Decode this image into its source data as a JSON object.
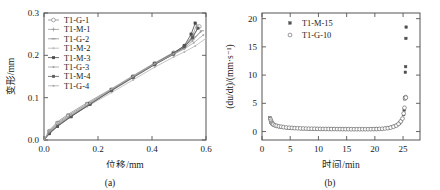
{
  "figure": {
    "panels": [
      {
        "id": "a",
        "caption": "(a)",
        "chart_ref": 0
      },
      {
        "id": "b",
        "caption": "(b)",
        "chart_ref": 1
      }
    ]
  },
  "chart_data": [
    {
      "type": "line",
      "title": "",
      "xlabel": "位移/mm",
      "ylabel": "变形/mm",
      "xlim": [
        0.0,
        0.6
      ],
      "ylim": [
        0.0,
        0.3
      ],
      "xticks": [
        "0.0",
        "0.2",
        "0.4",
        "0.6"
      ],
      "yticks": [
        "0.0",
        "0.1",
        "0.2",
        "0.3"
      ],
      "grid": false,
      "legend_position": "top-left",
      "series": [
        {
          "name": "T1-G-1",
          "marker": "open-circle",
          "color": "#8a8a8a",
          "x": [
            0.0,
            0.02,
            0.05,
            0.09,
            0.16,
            0.25,
            0.33,
            0.41,
            0.48,
            0.52,
            0.55,
            0.575
          ],
          "y": [
            0.0,
            0.021,
            0.04,
            0.058,
            0.085,
            0.119,
            0.15,
            0.181,
            0.206,
            0.222,
            0.245,
            0.268
          ]
        },
        {
          "name": "T1-M-1",
          "marker": "plus",
          "color": "#9a9a9a",
          "x": [
            0.0,
            0.02,
            0.05,
            0.09,
            0.16,
            0.25,
            0.33,
            0.41,
            0.48,
            0.52,
            0.55,
            0.565
          ],
          "y": [
            0.0,
            0.019,
            0.037,
            0.055,
            0.082,
            0.116,
            0.147,
            0.178,
            0.203,
            0.22,
            0.246,
            0.272
          ]
        },
        {
          "name": "T1-G-2",
          "marker": "dash",
          "color": "#8f8f8f",
          "x": [
            0.0,
            0.02,
            0.05,
            0.09,
            0.16,
            0.25,
            0.33,
            0.41,
            0.48,
            0.52,
            0.55,
            0.585
          ],
          "y": [
            0.0,
            0.023,
            0.043,
            0.061,
            0.088,
            0.121,
            0.152,
            0.182,
            0.207,
            0.221,
            0.238,
            0.258
          ]
        },
        {
          "name": "T1-M-2",
          "marker": "dot",
          "color": "#b5b5b5",
          "x": [
            0.0,
            0.02,
            0.05,
            0.09,
            0.16,
            0.25,
            0.33,
            0.41,
            0.48,
            0.52,
            0.56,
            0.6
          ],
          "y": [
            0.0,
            0.017,
            0.034,
            0.052,
            0.079,
            0.112,
            0.142,
            0.172,
            0.196,
            0.208,
            0.222,
            0.24
          ]
        },
        {
          "name": "T1-M-3",
          "marker": "filled-square",
          "color": "#4a4a4a",
          "x": [
            0.0,
            0.02,
            0.05,
            0.1,
            0.17,
            0.25,
            0.33,
            0.41,
            0.48,
            0.52,
            0.545,
            0.56
          ],
          "y": [
            0.0,
            0.015,
            0.032,
            0.055,
            0.085,
            0.118,
            0.149,
            0.18,
            0.205,
            0.223,
            0.25,
            0.276
          ]
        },
        {
          "name": "T1-G-3",
          "marker": "small-dot",
          "color": "#9d9d9d",
          "x": [
            0.0,
            0.02,
            0.05,
            0.1,
            0.17,
            0.25,
            0.33,
            0.41,
            0.48,
            0.52,
            0.55,
            0.58
          ],
          "y": [
            0.0,
            0.018,
            0.036,
            0.058,
            0.086,
            0.119,
            0.149,
            0.179,
            0.202,
            0.216,
            0.234,
            0.256
          ]
        },
        {
          "name": "T1-M-4",
          "marker": "filled-square",
          "color": "#5a5a5a",
          "x": [
            0.0,
            0.02,
            0.05,
            0.1,
            0.17,
            0.25,
            0.33,
            0.41,
            0.48,
            0.52,
            0.55,
            0.57
          ],
          "y": [
            0.0,
            0.016,
            0.033,
            0.056,
            0.084,
            0.117,
            0.148,
            0.178,
            0.203,
            0.219,
            0.242,
            0.264
          ]
        },
        {
          "name": "T1-G-4",
          "marker": "small-dot",
          "color": "#a8a8a8",
          "x": [
            0.0,
            0.02,
            0.05,
            0.1,
            0.17,
            0.25,
            0.33,
            0.41,
            0.48,
            0.52,
            0.555,
            0.59
          ],
          "y": [
            0.0,
            0.02,
            0.038,
            0.059,
            0.087,
            0.12,
            0.15,
            0.18,
            0.204,
            0.215,
            0.23,
            0.248
          ]
        }
      ]
    },
    {
      "type": "scatter",
      "title": "",
      "xlabel": "时间/min",
      "ylabel": "(du/dt)/(mm·s⁻¹)",
      "xlim": [
        0,
        28
      ],
      "ylim": [
        -1.5,
        21
      ],
      "xticks": [
        "0",
        "5",
        "10",
        "15",
        "20",
        "25"
      ],
      "yticks": [
        "0",
        "5",
        "10",
        "15",
        "20"
      ],
      "grid": false,
      "legend_position": "top-left",
      "series": [
        {
          "name": "T1-M-15",
          "marker": "filled-square",
          "color": "#4f4f4f",
          "x": [
            1.4,
            1.5,
            1.6,
            1.7,
            1.8,
            1.9,
            2.0,
            2.2,
            2.5,
            2.8,
            3.1,
            3.5,
            4.0,
            4.5,
            5.0,
            5.5,
            6.0,
            6.5,
            7.0,
            7.5,
            8.0,
            8.5,
            9.0,
            9.5,
            10.0,
            10.5,
            11.0,
            11.5,
            12.0,
            12.5,
            13.0,
            13.5,
            14.0,
            14.5,
            15.0,
            15.5,
            16.0,
            16.5,
            17.0,
            17.5,
            18.0,
            18.5,
            19.0,
            19.5,
            20.0,
            20.5,
            21.0,
            21.5,
            22.0,
            22.5,
            23.0,
            23.5,
            24.0,
            24.4,
            24.7,
            24.9,
            25.1,
            25.2,
            25.3,
            25.35,
            25.4,
            25.45,
            25.5,
            25.55
          ],
          "y": [
            2.4,
            2.0,
            1.7,
            1.5,
            1.4,
            1.3,
            1.2,
            1.1,
            1.0,
            0.9,
            0.85,
            0.8,
            0.7,
            0.65,
            0.6,
            0.6,
            0.55,
            0.55,
            0.5,
            0.5,
            0.5,
            0.48,
            0.47,
            0.46,
            0.45,
            0.45,
            0.44,
            0.44,
            0.43,
            0.43,
            0.42,
            0.42,
            0.42,
            0.41,
            0.41,
            0.41,
            0.4,
            0.4,
            0.4,
            0.4,
            0.4,
            0.4,
            0.41,
            0.42,
            0.43,
            0.45,
            0.48,
            0.52,
            0.58,
            0.66,
            0.78,
            0.95,
            1.2,
            1.5,
            1.9,
            2.3,
            3.0,
            3.8,
            5.8,
            6.0,
            10.5,
            11.5,
            16.5,
            18.5
          ]
        },
        {
          "name": "T1-G-10",
          "marker": "open-circle",
          "color": "#6f6f6f",
          "x": [
            1.5,
            1.6,
            1.7,
            1.8,
            1.9,
            2.0,
            2.3,
            2.6,
            3.0,
            3.4,
            3.8,
            4.3,
            4.8,
            5.3,
            5.8,
            6.3,
            6.8,
            7.3,
            7.8,
            8.3,
            8.8,
            9.3,
            9.8,
            10.3,
            10.8,
            11.3,
            11.8,
            12.3,
            12.8,
            13.3,
            13.8,
            14.3,
            14.8,
            15.3,
            15.8,
            16.3,
            16.8,
            17.3,
            17.8,
            18.3,
            18.8,
            19.3,
            19.8,
            20.3,
            20.8,
            21.3,
            21.8,
            22.3,
            22.8,
            23.3,
            23.8,
            24.2,
            24.6,
            24.9,
            25.1,
            25.25,
            25.35,
            25.45,
            25.5
          ],
          "y": [
            2.2,
            1.9,
            1.6,
            1.45,
            1.35,
            1.25,
            1.1,
            1.0,
            0.92,
            0.85,
            0.78,
            0.72,
            0.68,
            0.64,
            0.6,
            0.58,
            0.56,
            0.54,
            0.52,
            0.5,
            0.5,
            0.49,
            0.48,
            0.47,
            0.46,
            0.45,
            0.45,
            0.44,
            0.44,
            0.43,
            0.43,
            0.42,
            0.42,
            0.42,
            0.41,
            0.41,
            0.41,
            0.41,
            0.41,
            0.41,
            0.41,
            0.42,
            0.43,
            0.44,
            0.46,
            0.49,
            0.54,
            0.6,
            0.7,
            0.85,
            1.05,
            1.35,
            1.8,
            2.3,
            3.2,
            4.2,
            5.9,
            6.1,
            6.0
          ]
        }
      ]
    }
  ]
}
